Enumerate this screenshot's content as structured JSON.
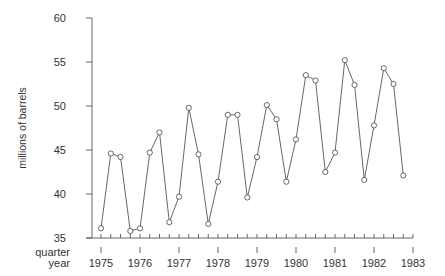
{
  "chart_data": {
    "type": "line",
    "title": "",
    "xlabel": "quarter / year",
    "ylabel": "millions of barrels",
    "x_row_labels": [
      "quarter",
      "year"
    ],
    "ylim": [
      35,
      60
    ],
    "yticks": [
      35,
      40,
      45,
      50,
      55,
      60
    ],
    "xlim": [
      1975,
      1983
    ],
    "xticks": [
      1975,
      1976,
      1977,
      1978,
      1979,
      1980,
      1981,
      1982,
      1983
    ],
    "minor_xticks": "quarterly",
    "grid": false,
    "legend": null,
    "marker": "open-circle",
    "series": [
      {
        "name": "production",
        "x": [
          1975.0,
          1975.25,
          1975.5,
          1975.75,
          1976.0,
          1976.25,
          1976.5,
          1976.75,
          1977.0,
          1977.25,
          1977.5,
          1977.75,
          1978.0,
          1978.25,
          1978.5,
          1978.75,
          1979.0,
          1979.25,
          1979.5,
          1979.75,
          1980.0,
          1980.25,
          1980.5,
          1980.75,
          1981.0,
          1981.25,
          1981.5,
          1981.75,
          1982.0,
          1982.25,
          1982.5,
          1982.75
        ],
        "values": [
          36.1,
          44.6,
          44.2,
          35.8,
          36.1,
          44.7,
          47.0,
          36.8,
          39.7,
          49.8,
          44.5,
          36.6,
          41.4,
          49.0,
          49.0,
          39.6,
          44.2,
          50.1,
          48.5,
          41.4,
          46.2,
          53.5,
          52.9,
          42.5,
          44.7,
          55.2,
          52.4,
          41.6,
          47.8,
          54.3,
          52.5,
          42.1
        ]
      }
    ]
  },
  "colors": {
    "line": "#555555",
    "marker_stroke": "#444444",
    "axis": "#666666",
    "text": "#333333",
    "background": "#ffffff"
  }
}
